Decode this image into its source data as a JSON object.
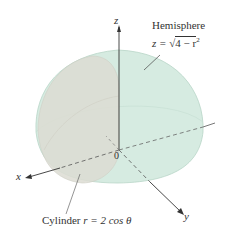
{
  "labels": {
    "hemisphere_title": "Hemisphere",
    "hemisphere_eq": "z = √4 − r²",
    "hemisphere_eq_lhs": "z =",
    "hemisphere_eq_rad": "4 − r",
    "hemisphere_eq_exp": "2",
    "cylinder_label": "Cylinder r = 2 cos θ",
    "cylinder_word": "Cylinder",
    "cylinder_eq": "r = 2 cos θ",
    "axis_x": "x",
    "axis_y": "y",
    "axis_z": "z",
    "origin": "0"
  },
  "colors": {
    "hemisphere_fill": "#d6ebe1",
    "cylinder_fill": "#dcdcd2",
    "axis": "#333333",
    "background": "#ffffff"
  }
}
